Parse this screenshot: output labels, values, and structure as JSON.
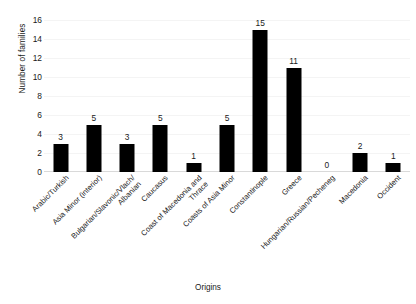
{
  "chart_data": {
    "type": "bar",
    "title": "",
    "xlabel": "Origins",
    "ylabel": "Number of families",
    "categories": [
      "Arabic/Turkish",
      "Asia Minor (interior)",
      "Bulgarian/Slavonic/Vlach/\nAlbanian",
      "Caucasus",
      "Coast of Macedonia and\nThrace",
      "Coasts of Asia Minor",
      "Constantinople",
      "Greece",
      "Hungarian/Russian/Pecheneg",
      "Macedonia",
      "Occident"
    ],
    "values": [
      3,
      5,
      3,
      5,
      1,
      5,
      15,
      11,
      0,
      2,
      1
    ],
    "value_labels": [
      "3",
      "5",
      "3",
      "5",
      "1",
      "5",
      "15",
      "11",
      "0",
      "2",
      "1"
    ],
    "ylim": [
      0,
      16
    ],
    "ytick_labels": [
      "0",
      "2",
      "4",
      "6",
      "8",
      "10",
      "12",
      "14",
      "16"
    ],
    "ytick_values": [
      0,
      2,
      4,
      6,
      8,
      10,
      12,
      14,
      16
    ],
    "grid": "horizontal-faint",
    "legend": "none",
    "bar_color": "#000000",
    "background_color": "#ffffff",
    "xtick_label_rotation": "-45"
  }
}
